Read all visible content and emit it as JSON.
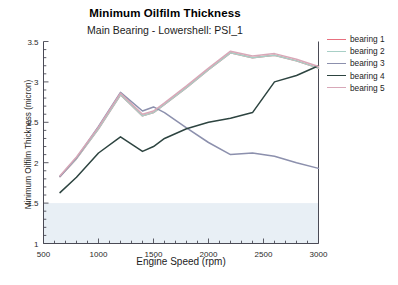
{
  "chart_data": {
    "type": "line",
    "title": "Minimum Oilfilm Thickness",
    "subtitle": "Main Bearing - Lowershell: PSI_1",
    "xlabel": "Engine Speed (rpm)",
    "ylabel": "Minimum Oilfilm Thickness (micron)",
    "xlim": [
      500,
      3000
    ],
    "ylim": [
      1,
      3.5
    ],
    "xticks": [
      500,
      1000,
      1500,
      2000,
      2500,
      3000
    ],
    "xtick_labels": [
      "500",
      "1000",
      "1500",
      "2000",
      "2500",
      "3000"
    ],
    "yticks": [
      1,
      1.5,
      2,
      2.5,
      3,
      3.5
    ],
    "ytick_labels": [
      "1",
      "1.5",
      "2",
      "2.5",
      "3",
      "3.5"
    ],
    "minor_tick_step_x": 100,
    "minor_tick_step_y": 0.1,
    "grid": false,
    "legend_position": "right",
    "shaded_band": {
      "name": "limit-band",
      "from": 1.0,
      "to": 1.5,
      "color": "#e8eff5"
    },
    "x": [
      650,
      800,
      1000,
      1200,
      1400,
      1500,
      1600,
      1800,
      2000,
      2200,
      2400,
      2600,
      2800,
      3000
    ],
    "series": [
      {
        "name": "bearing 1",
        "color": "#e8707f",
        "values": [
          1.83,
          2.05,
          2.42,
          2.84,
          2.58,
          2.62,
          2.72,
          2.93,
          3.15,
          3.36,
          3.3,
          3.33,
          3.26,
          3.17
        ]
      },
      {
        "name": "bearing 2",
        "color": "#a8cfc6",
        "values": [
          1.83,
          2.05,
          2.42,
          2.84,
          2.58,
          2.62,
          2.72,
          2.93,
          3.15,
          3.36,
          3.3,
          3.33,
          3.26,
          3.17
        ]
      },
      {
        "name": "bearing 3",
        "color": "#8c90ad",
        "values": [
          1.83,
          2.06,
          2.45,
          2.87,
          2.64,
          2.69,
          2.62,
          2.43,
          2.25,
          2.1,
          2.12,
          2.08,
          2.0,
          1.93
        ]
      },
      {
        "name": "bearing 4",
        "color": "#2d4440",
        "values": [
          1.63,
          1.82,
          2.12,
          2.32,
          2.14,
          2.2,
          2.3,
          2.42,
          2.5,
          2.55,
          2.62,
          3.0,
          3.08,
          3.2
        ]
      },
      {
        "name": "bearing 5",
        "color": "#d8a8b8",
        "values": [
          1.84,
          2.07,
          2.44,
          2.86,
          2.6,
          2.64,
          2.74,
          2.95,
          3.17,
          3.38,
          3.32,
          3.35,
          3.28,
          3.19
        ]
      }
    ]
  },
  "legend": {
    "items": [
      {
        "label": "bearing 1",
        "color": "#e8707f"
      },
      {
        "label": "bearing 2",
        "color": "#a8cfc6"
      },
      {
        "label": "bearing 3",
        "color": "#8c90ad"
      },
      {
        "label": "bearing 4",
        "color": "#2d4440"
      },
      {
        "label": "bearing 5",
        "color": "#d8a8b8"
      }
    ]
  }
}
